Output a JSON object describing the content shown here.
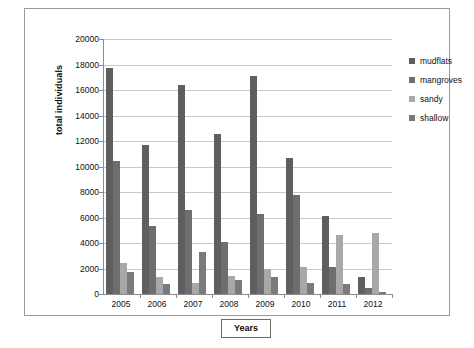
{
  "chart_data": {
    "type": "bar",
    "title": "",
    "xlabel": "Years",
    "ylabel": "total individuals",
    "categories": [
      "2005",
      "2006",
      "2007",
      "2008",
      "2009",
      "2010",
      "2011",
      "2012"
    ],
    "ylim": [
      0,
      20000
    ],
    "ytick_step": 2000,
    "yticks": [
      "0",
      "2000",
      "4000",
      "6000",
      "8000",
      "10000",
      "12000",
      "14000",
      "16000",
      "18000",
      "20000"
    ],
    "grid": "horizontal",
    "legend_position": "right",
    "series": [
      {
        "name": "mudflats",
        "color": "#5f5f5f",
        "values": [
          17700,
          11700,
          16400,
          12550,
          17100,
          10700,
          6100,
          1350
        ]
      },
      {
        "name": "mangroves",
        "color": "#6e6e6e",
        "values": [
          10400,
          5350,
          6600,
          4100,
          6300,
          7800,
          2100,
          450
        ]
      },
      {
        "name": "sandy",
        "color": "#a8a8a8",
        "values": [
          2450,
          1300,
          900,
          1450,
          2000,
          2100,
          4600,
          4800
        ]
      },
      {
        "name": "shallow",
        "color": "#7a7a7a",
        "values": [
          1750,
          800,
          3300,
          1100,
          1300,
          900,
          800,
          120
        ]
      }
    ]
  },
  "axes": {
    "y_title": "total individuals",
    "x_title": "Years"
  }
}
